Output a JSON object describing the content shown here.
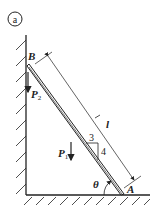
{
  "figure": {
    "panel_label": "a",
    "labels": {
      "point_B": "B",
      "point_A": "A",
      "length": "l",
      "angle": "θ",
      "force1": "P",
      "force1_sub": "1",
      "force2": "P",
      "force2_sub": "2",
      "slope_run": "3",
      "slope_rise": "4"
    },
    "colors": {
      "line": "#222222",
      "background": "#ffffff"
    }
  }
}
